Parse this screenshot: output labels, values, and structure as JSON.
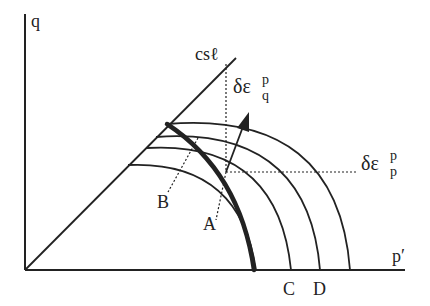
{
  "diagram": {
    "title": "",
    "axes": {
      "x_label": "p′",
      "y_label": "q"
    },
    "lines": {
      "csl_label": "csℓ"
    },
    "strain_increments": {
      "q_symbol": "δε",
      "q_sup": "p",
      "q_sub": "q",
      "p_symbol": "δε",
      "p_sup": "p",
      "p_sub": "p"
    },
    "points": {
      "A": "A",
      "B": "B",
      "C": "C",
      "D": "D"
    },
    "colors": {
      "ink": "#222222",
      "background": "#ffffff"
    }
  }
}
